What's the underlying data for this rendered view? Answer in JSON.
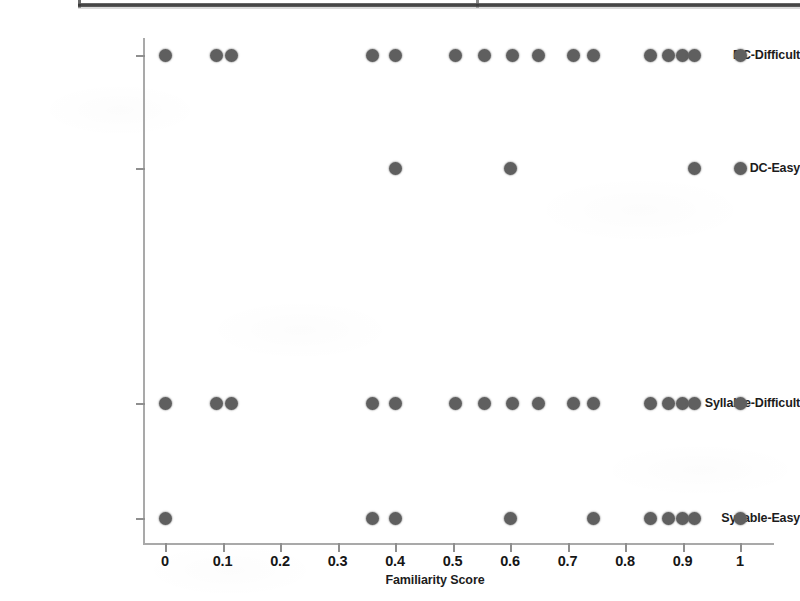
{
  "figure": {
    "artifact_note": "scanned-page-top-rule"
  },
  "axes": {
    "x_title": "Familiarity Score",
    "x_ticks": [
      "0",
      "0.1",
      "0.2",
      "0.3",
      "0.4",
      "0.5",
      "0.6",
      "0.7",
      "0.8",
      "0.9",
      "1"
    ],
    "y_ticks": [
      "DC-Difficult",
      "DC-Easy",
      "Syllable-Difficult",
      "Syllable-Easy"
    ]
  },
  "chart_data": {
    "type": "scatter",
    "title": "",
    "xlabel": "Familiarity Score",
    "ylabel": "",
    "xlim": [
      -0.04,
      1.06
    ],
    "xticks": [
      0,
      0.1,
      0.2,
      0.3,
      0.4,
      0.5,
      0.6,
      0.7,
      0.8,
      0.9,
      1
    ],
    "xticklabels": [
      "0",
      "0.1",
      "0.2",
      "0.3",
      "0.4",
      "0.5",
      "0.6",
      "0.7",
      "0.8",
      "0.9",
      "1"
    ],
    "categories": [
      "DC-Difficult",
      "DC-Easy",
      "Syllable-Difficult",
      "Syllable-Easy"
    ],
    "grid": false,
    "legend": null,
    "marker": {
      "shape": "circle",
      "color": "#5f5f5f",
      "size_px": 13
    },
    "series": [
      {
        "name": "DC-Difficult",
        "category_index": 0,
        "x": [
          0.0,
          0.09,
          0.115,
          0.36,
          0.4,
          0.505,
          0.555,
          0.605,
          0.65,
          0.71,
          0.745,
          0.845,
          0.875,
          0.9,
          0.92,
          1.0
        ],
        "count": 16
      },
      {
        "name": "DC-Easy",
        "category_index": 1,
        "x": [
          0.4,
          0.6,
          0.92,
          1.0
        ],
        "count": 4
      },
      {
        "name": "Syllable-Difficult",
        "category_index": 2,
        "x": [
          0.0,
          0.09,
          0.115,
          0.36,
          0.4,
          0.505,
          0.555,
          0.605,
          0.65,
          0.71,
          0.745,
          0.845,
          0.875,
          0.9,
          0.92,
          1.0
        ],
        "count": 16
      },
      {
        "name": "Syllable-Easy",
        "category_index": 3,
        "x": [
          0.0,
          0.36,
          0.4,
          0.6,
          0.745,
          0.845,
          0.875,
          0.9,
          0.92,
          1.0
        ],
        "count": 10
      }
    ]
  }
}
